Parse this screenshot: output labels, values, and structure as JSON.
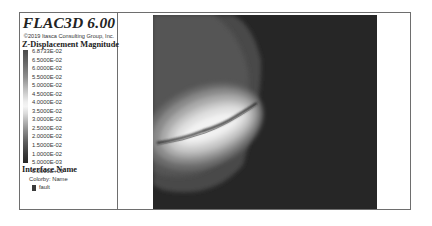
{
  "header": {
    "title": "FLAC3D 6.00",
    "copyright": "©2019 Itasca Consulting Group, Inc."
  },
  "legend": {
    "contour_title": "Z-Displacement Magnitude",
    "contour_labels": [
      "6.8733E-02",
      "6.5000E-02",
      "6.0000E-02",
      "5.5000E-02",
      "5.0000E-02",
      "4.5000E-02",
      "4.0000E-02",
      "3.5000E-02",
      "3.0000E-02",
      "2.5000E-02",
      "2.0000E-02",
      "1.5000E-02",
      "1.0000E-02",
      "5.0000E-03",
      "0.0000E+00"
    ],
    "interface_title": "Interface Name",
    "colorby": "Colorby: Name",
    "interface_items": [
      {
        "label": "fault",
        "color": "#3a3a3a"
      }
    ]
  },
  "plot": {
    "background": "#2a2a2a",
    "description": "Grayscale contour of Z-displacement around inclined fault plane"
  }
}
